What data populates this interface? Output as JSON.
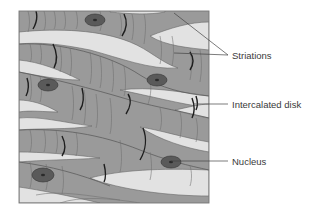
{
  "diagram": {
    "colors": {
      "fiber": "#9a9a9a",
      "fiber_edge": "#555555",
      "gap": "#e2e2e2",
      "striation": "#6e6e6e",
      "disk": "#1e1e1e",
      "nucleus_outer": "#5a5a5a",
      "nucleus_inner": "#3a3a3a",
      "leader": "#444444",
      "text": "#3a3a3a"
    },
    "labels": [
      {
        "id": "striations",
        "text": "Striations"
      },
      {
        "id": "intercalated-disk",
        "text": "Intercalated disk"
      },
      {
        "id": "nucleus",
        "text": "Nucleus"
      }
    ]
  }
}
